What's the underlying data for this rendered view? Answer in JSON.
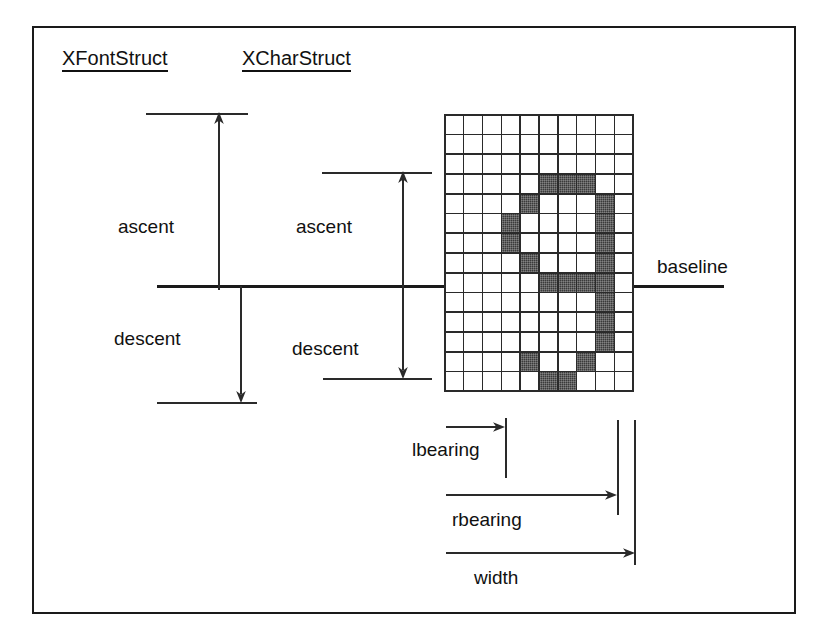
{
  "diagram": {
    "title_font_struct": "XFontStruct",
    "title_char_struct": "XCharStruct",
    "labels": {
      "font_ascent": "ascent",
      "font_descent": "descent",
      "char_ascent": "ascent",
      "char_descent": "descent",
      "baseline": "baseline",
      "lbearing": "lbearing",
      "rbearing": "rbearing",
      "width": "width"
    },
    "colors": {
      "ink": "#1a1a1a",
      "line": "#2a2a2a",
      "pixel_on": "#3a3a3a",
      "pixel_off": "#ffffff",
      "background": "#ffffff"
    },
    "glyph": {
      "character": "a",
      "grid_columns": 10,
      "grid_rows": 14,
      "baseline_row": 9,
      "pixels": [
        [
          0,
          0,
          0,
          0,
          0,
          0,
          0,
          0,
          0,
          0
        ],
        [
          0,
          0,
          0,
          0,
          0,
          0,
          0,
          0,
          0,
          0
        ],
        [
          0,
          0,
          0,
          0,
          0,
          0,
          0,
          0,
          0,
          0
        ],
        [
          0,
          0,
          0,
          0,
          0,
          1,
          1,
          1,
          0,
          0
        ],
        [
          0,
          0,
          0,
          0,
          1,
          0,
          0,
          0,
          1,
          0
        ],
        [
          0,
          0,
          0,
          1,
          0,
          0,
          0,
          0,
          1,
          0
        ],
        [
          0,
          0,
          0,
          1,
          0,
          0,
          0,
          0,
          1,
          0
        ],
        [
          0,
          0,
          0,
          0,
          1,
          0,
          0,
          0,
          1,
          0
        ],
        [
          0,
          0,
          0,
          0,
          0,
          1,
          1,
          1,
          1,
          0
        ],
        [
          0,
          0,
          0,
          0,
          0,
          0,
          0,
          0,
          1,
          0
        ],
        [
          0,
          0,
          0,
          0,
          0,
          0,
          0,
          0,
          1,
          0
        ],
        [
          0,
          0,
          0,
          0,
          0,
          0,
          0,
          0,
          1,
          0
        ],
        [
          0,
          0,
          0,
          0,
          1,
          0,
          0,
          1,
          0,
          0
        ],
        [
          0,
          0,
          0,
          0,
          0,
          1,
          1,
          0,
          0,
          0
        ]
      ]
    }
  }
}
